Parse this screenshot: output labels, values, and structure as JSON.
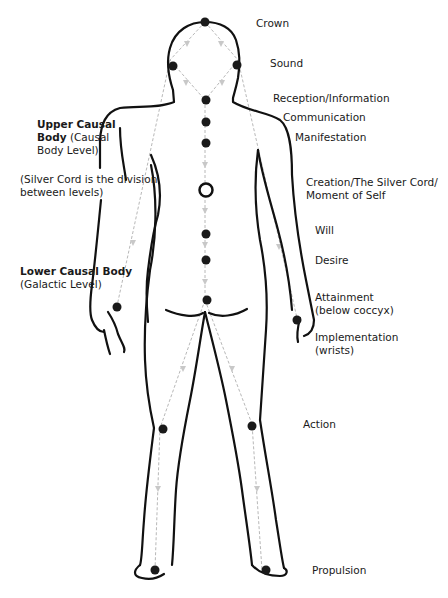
{
  "diagram": {
    "colors": {
      "outline": "#111111",
      "cord": "#b8b8b8",
      "point": "#1a1a1a",
      "background": "#ffffff"
    }
  },
  "labels": {
    "crown": "Crown",
    "sound": "Sound",
    "reception": "Reception/Information",
    "communication": "Communication",
    "manifestation": "Manifestation",
    "creation_line1": "Creation/The Silver Cord/",
    "creation_line2": "Moment of Self",
    "will": "Will",
    "desire": "Desire",
    "attainment_line1": "Attainment",
    "attainment_line2": "(below coccyx)",
    "implementation_line1": "Implementation",
    "implementation_line2": "(wrists)",
    "action": "Action",
    "propulsion": "Propulsion"
  },
  "levels": {
    "upper_bold1": "Upper Causal",
    "upper_bold2": "Body",
    "upper_rest2": " (Causal",
    "upper_line3": "Body Level)",
    "division_line1": "(Silver Cord is the division",
    "division_line2": "between levels)",
    "lower_bold": "Lower Causal Body",
    "lower_line2": "(Galactic Level)"
  },
  "points": [
    {
      "name": "crown",
      "type": "filled"
    },
    {
      "name": "sound-left",
      "type": "filled"
    },
    {
      "name": "sound-right",
      "type": "filled"
    },
    {
      "name": "reception",
      "type": "filled"
    },
    {
      "name": "communication",
      "type": "filled"
    },
    {
      "name": "manifestation",
      "type": "filled"
    },
    {
      "name": "creation",
      "type": "ring"
    },
    {
      "name": "will",
      "type": "filled"
    },
    {
      "name": "desire",
      "type": "filled"
    },
    {
      "name": "attainment",
      "type": "filled"
    },
    {
      "name": "implementation-left",
      "type": "filled"
    },
    {
      "name": "implementation-right",
      "type": "filled"
    },
    {
      "name": "action-left",
      "type": "filled"
    },
    {
      "name": "action-right",
      "type": "filled"
    },
    {
      "name": "propulsion-left",
      "type": "filled"
    },
    {
      "name": "propulsion-right",
      "type": "filled"
    }
  ]
}
